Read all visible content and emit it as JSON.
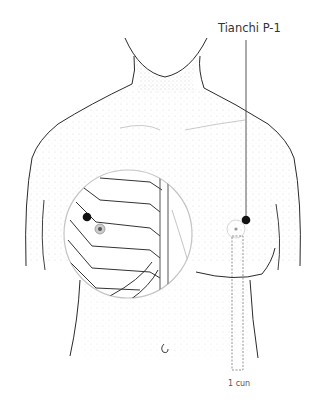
{
  "figure": {
    "type": "anatomical-illustration"
  },
  "labels": {
    "point_name": "Tianchi P-1",
    "measurement": "1 cun"
  },
  "colors": {
    "outline": "#2a2a2a",
    "stipple": "#9a9a9a",
    "point_marker": "#111111",
    "inset_circle": "#bdbdbd",
    "text": "#333333"
  }
}
